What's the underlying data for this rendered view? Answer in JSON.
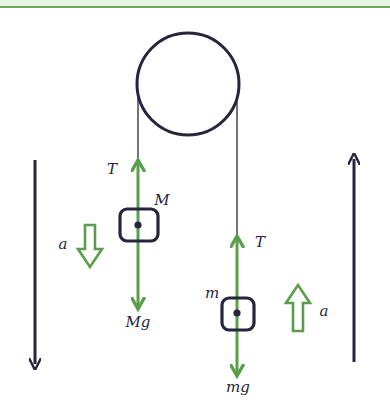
{
  "diagram": {
    "colors": {
      "background": "#ffffff",
      "header_tint": "#e8f4e2",
      "header_line": "#6aa85c",
      "ink": "#26253d",
      "force": "#5a9e4a",
      "accel_arrow": "#5a9e4a"
    },
    "pulley": {
      "cx": 188,
      "cy": 84,
      "r": 51
    },
    "ropes": [
      {
        "name": "left-rope",
        "x": 138,
        "y1": 84,
        "y2": 162
      },
      {
        "name": "right-rope",
        "x": 237,
        "y1": 84,
        "y2": 238
      }
    ],
    "masses": [
      {
        "name": "mass-M",
        "label": "M",
        "box": {
          "x": 120,
          "y": 209,
          "w": 38,
          "h": 32
        },
        "center": {
          "x": 138,
          "y": 225
        },
        "label_pos": {
          "x": 158,
          "y": 205
        },
        "tension": {
          "label": "T",
          "tip_y": 160,
          "label_pos": {
            "x": 112,
            "y": 174
          }
        },
        "weight": {
          "label": "Mg",
          "tip_y": 309,
          "label_pos": {
            "x": 138,
            "y": 327
          }
        },
        "acceleration": {
          "label": "a",
          "direction": "down",
          "x": 90,
          "y_top": 225,
          "y_bottom": 267,
          "label_pos": {
            "x": 63,
            "y": 249
          }
        }
      },
      {
        "name": "mass-m",
        "label": "m",
        "box": {
          "x": 222,
          "y": 298,
          "w": 32,
          "h": 32
        },
        "center": {
          "x": 237,
          "y": 313
        },
        "label_pos": {
          "x": 211,
          "y": 298
        },
        "tension": {
          "label": "T",
          "tip_y": 236,
          "label_pos": {
            "x": 258,
            "y": 247
          }
        },
        "weight": {
          "label": "mg",
          "tip_y": 376,
          "label_pos": {
            "x": 238,
            "y": 392
          }
        },
        "acceleration": {
          "label": "a",
          "direction": "up",
          "x": 298,
          "y_top": 285,
          "y_bottom": 331,
          "label_pos": {
            "x": 324,
            "y": 316
          }
        }
      }
    ],
    "motion_arrows": [
      {
        "name": "left-motion-arrow",
        "direction": "down",
        "x": 35,
        "y_top": 160,
        "y_bottom": 366
      },
      {
        "name": "right-motion-arrow",
        "direction": "up",
        "x": 354,
        "y_top": 157,
        "y_bottom": 362
      }
    ]
  }
}
